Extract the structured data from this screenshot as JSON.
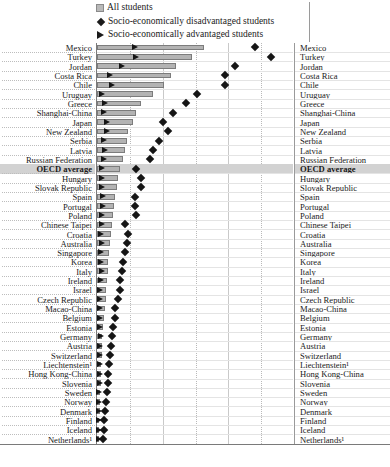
{
  "legend": {
    "items": [
      {
        "marker": "bar-swatch-icon",
        "label": "All students"
      },
      {
        "marker": "diamond-marker-icon",
        "label": "Socio-economically disadvantaged students"
      },
      {
        "marker": "triangle-marker-icon",
        "label": "Socio-economically advantaged students"
      }
    ]
  },
  "axis": {
    "ticks": [
      "0",
      "10",
      "20",
      "30",
      "40",
      "50",
      "60"
    ],
    "unit": "%",
    "min": 0,
    "max": 60,
    "last_tick_label": "60 %"
  },
  "chart_data": {
    "type": "bar",
    "title": "",
    "xlabel": "%",
    "ylabel": "",
    "xlim": [
      0,
      60
    ],
    "grid": true,
    "legend_position": "top",
    "categories": [
      "Mexico",
      "Turkey",
      "Jordan",
      "Costa Rica",
      "Chile",
      "Uruguay",
      "Greece",
      "Shanghai-China",
      "Japan",
      "New Zealand",
      "Serbia",
      "Latvia",
      "Russian Federation",
      "OECD average",
      "Hungary",
      "Slovak Republic",
      "Spain",
      "Portugal",
      "Poland",
      "Chinese Taipei",
      "Croatia",
      "Australia",
      "Singapore",
      "Korea",
      "Italy",
      "Ireland",
      "Israel",
      "Czech Republic",
      "Macao-China",
      "Belgium",
      "Estonia",
      "Germany",
      "Austria",
      "Switzerland",
      "Liechtenstein¹",
      "Hong Kong-China",
      "Slovenia",
      "Sweden",
      "Norway",
      "Denmark",
      "Finland",
      "Iceland",
      "Netherlands¹"
    ],
    "highlight_category": "OECD average",
    "series": [
      {
        "name": "All students",
        "marker": "bar",
        "values": [
          32.5,
          29.0,
          24.0,
          22.5,
          20.5,
          17.0,
          13.5,
          12.0,
          11.0,
          9.5,
          9.0,
          8.5,
          8.0,
          7.0,
          6.5,
          6.0,
          5.5,
          5.2,
          5.0,
          4.5,
          4.3,
          4.0,
          3.6,
          3.4,
          3.2,
          3.0,
          2.8,
          2.6,
          2.3,
          2.0,
          1.8,
          1.6,
          1.5,
          1.4,
          1.3,
          1.2,
          1.1,
          1.0,
          0.9,
          0.8,
          0.7,
          0.6,
          0.5
        ]
      },
      {
        "name": "Socio-economically disadvantaged students",
        "marker": "diamond",
        "values": [
          48.0,
          53.0,
          42.0,
          39.0,
          39.0,
          30.5,
          27.0,
          23.0,
          20.0,
          21.5,
          19.0,
          17.0,
          16.0,
          12.0,
          13.5,
          13.5,
          11.5,
          11.5,
          12.0,
          8.5,
          9.5,
          9.0,
          8.5,
          8.0,
          7.5,
          7.0,
          7.0,
          6.5,
          5.5,
          5.5,
          5.0,
          4.5,
          4.2,
          4.0,
          3.6,
          3.4,
          3.2,
          3.0,
          2.8,
          2.5,
          2.2,
          2.0,
          1.8
        ]
      },
      {
        "name": "Socio-economically advantaged students",
        "marker": "triangle",
        "values": [
          11.6,
          12.0,
          7.5,
          4.0,
          4.5,
          1.5,
          2.5,
          2.2,
          3.0,
          3.0,
          2.0,
          2.5,
          2.0,
          1.5,
          1.5,
          1.5,
          1.8,
          1.8,
          1.5,
          1.5,
          1.2,
          1.5,
          1.3,
          1.2,
          1.5,
          1.2,
          1.0,
          1.0,
          0.8,
          1.0,
          1.0,
          1.2,
          1.0,
          1.0,
          0.8,
          0.8,
          0.8,
          0.7,
          0.7,
          0.6,
          0.6,
          0.6,
          0.5
        ]
      }
    ]
  }
}
